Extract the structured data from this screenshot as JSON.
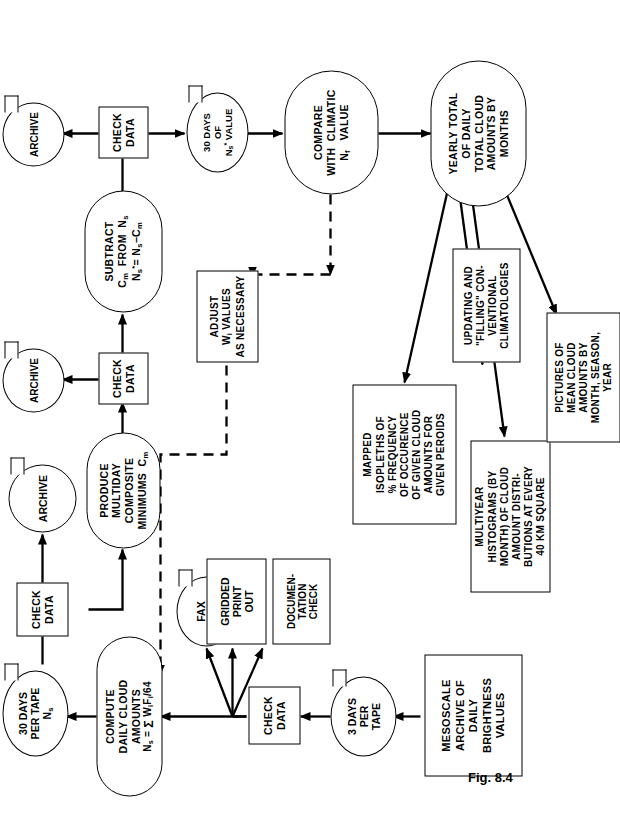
{
  "figure": {
    "caption": "Fig. 8.4",
    "ink_color": "#000000",
    "background_color": "#ffffff",
    "orientation": "landscape diagram rotated 90 degrees on a portrait page"
  },
  "nodes": {
    "mesoscale_archive": {
      "shape": "rectangle",
      "label": "MESOSCALE\nARCHIVE OF\nDAILY\nBRIGHTNESS\nVALUES"
    },
    "three_days_tape": {
      "shape": "tape",
      "label": "3 DAYS\nPER\nTAPE"
    },
    "check_data_1": {
      "shape": "rectangle",
      "label": "CHECK\nDATA"
    },
    "fax_picture": {
      "shape": "tape",
      "label": "FAX\nPICTURE"
    },
    "gridded_print_out": {
      "shape": "document",
      "label": "GRIDDED\nPRINT\nOUT"
    },
    "documentation_check": {
      "shape": "document",
      "label": "DOCUMEN-\nTATION\nCHECK"
    },
    "compute_daily": {
      "shape": "oval",
      "label_lines": [
        "COMPUTE",
        "DAILY  CLOUD",
        "AMOUNTS"
      ],
      "formula": "N_s = Σ W_i F_i /64"
    },
    "thirty_days_tape": {
      "shape": "tape",
      "label": "30  DAYS\nPER TAPE",
      "symbol": "N_s"
    },
    "check_data_2": {
      "shape": "rectangle",
      "label": "CHECK\nDATA"
    },
    "archive_1": {
      "shape": "tape",
      "label": "ARCHIVE"
    },
    "produce_multiday": {
      "shape": "oval",
      "label_lines": [
        "PRODUCE",
        "MULTIDAY",
        "COMPOSITE",
        "MINIMUMS"
      ],
      "symbol": "C_m"
    },
    "check_data_3": {
      "shape": "rectangle",
      "label": "CHECK\nDATA"
    },
    "archive_2": {
      "shape": "tape",
      "label": "ARCHIVE"
    },
    "subtract": {
      "shape": "oval",
      "label_lines": [
        "SUBTRACT",
        "C_m  FROM   N_s",
        "N_s* = N_s − C_m"
      ]
    },
    "check_data_4": {
      "shape": "rectangle",
      "label": "CHECK\nDATA"
    },
    "archive_3": {
      "shape": "tape",
      "label": "ARCHIVE"
    },
    "thirty_days_value": {
      "shape": "tape",
      "label": "30 DAYS\nOF\nN_s* VALUE"
    },
    "compare_climatic": {
      "shape": "oval",
      "label_lines": [
        "COMPARE",
        "WITH  CLIMATIC",
        "N_f   VALUE"
      ]
    },
    "adjust_w": {
      "shape": "rectangle",
      "label": "ADJUST\nW_i VALUES\nAS NECESSARY"
    },
    "yearly_total": {
      "shape": "oval",
      "label_lines": [
        "YEARLY TOTAL",
        "OF DAILY",
        "TOTAL  CLOUD",
        "AMOUNTS BY",
        "MONTHS"
      ]
    },
    "mapped_isopleths": {
      "shape": "rectangle",
      "label": "MAPPED\nISOPLETHS OF\n% FREQUENCY\nOF OCCURENCE\nOF GIVEN CLOUD\nAMOUNTS FOR\nGIVEN  PEROIDS"
    },
    "updating_filling": {
      "shape": "rectangle",
      "label": "UPDATING AND\n\"FILLING\" CON-\nVENTIONAL\nCLIMATOLOGIES"
    },
    "multiyear_hist": {
      "shape": "rectangle",
      "label": "MULTIYEAR\nHISTOGRAMS (BY\nMONTH) OF CLOUD\nAMOUNT DISTRI-\nBUTIONS AT EVERY\n40 KM SQUARE"
    },
    "pictures_mean": {
      "shape": "rectangle",
      "label": "PICTURES OF\nMEAN CLOUD\nAMOUNTS BY\nMONTH, SEASON,\nYEAR"
    }
  },
  "edges": [
    {
      "from": "mesoscale_archive",
      "to": "three_days_tape",
      "style": "solid"
    },
    {
      "from": "three_days_tape",
      "to": "check_data_1",
      "style": "solid"
    },
    {
      "from": "check_data_1",
      "to": "fax_picture",
      "style": "solid"
    },
    {
      "from": "check_data_1",
      "to": "gridded_print_out",
      "style": "solid"
    },
    {
      "from": "check_data_1",
      "to": "documentation_check",
      "style": "solid"
    },
    {
      "from": "check_data_1",
      "to": "compute_daily",
      "style": "solid"
    },
    {
      "from": "compute_daily",
      "to": "thirty_days_tape",
      "style": "solid"
    },
    {
      "from": "thirty_days_tape",
      "to": "check_data_2",
      "style": "solid"
    },
    {
      "from": "check_data_2",
      "to": "archive_1",
      "style": "solid"
    },
    {
      "from": "check_data_2",
      "to": "produce_multiday",
      "style": "solid"
    },
    {
      "from": "produce_multiday",
      "to": "check_data_3",
      "style": "solid"
    },
    {
      "from": "check_data_3",
      "to": "archive_2",
      "style": "solid"
    },
    {
      "from": "check_data_3",
      "to": "subtract",
      "style": "solid"
    },
    {
      "from": "subtract",
      "to": "check_data_4",
      "style": "solid"
    },
    {
      "from": "check_data_4",
      "to": "archive_3",
      "style": "solid"
    },
    {
      "from": "check_data_4",
      "to": "thirty_days_value",
      "style": "solid"
    },
    {
      "from": "thirty_days_value",
      "to": "compare_climatic",
      "style": "solid"
    },
    {
      "from": "compare_climatic",
      "to": "adjust_w",
      "style": "dashed"
    },
    {
      "from": "adjust_w",
      "to": "compute_daily",
      "style": "dashed"
    },
    {
      "from": "compare_climatic",
      "to": "yearly_total",
      "style": "solid"
    },
    {
      "from": "yearly_total",
      "to": "mapped_isopleths",
      "style": "solid"
    },
    {
      "from": "yearly_total",
      "to": "updating_filling",
      "style": "solid"
    },
    {
      "from": "yearly_total",
      "to": "multiyear_hist",
      "style": "solid"
    },
    {
      "from": "yearly_total",
      "to": "pictures_mean",
      "style": "solid"
    }
  ]
}
